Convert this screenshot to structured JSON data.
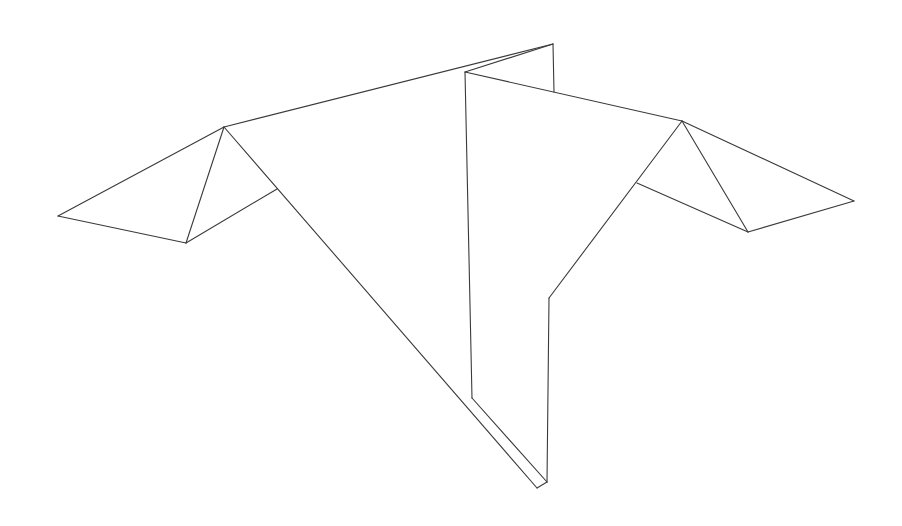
{
  "figure": {
    "stroke_color": "#3a3a3a",
    "background": "#ffffff",
    "edges": [
      {
        "id": "left-wing-upper",
        "x1": 58,
        "y1": 216,
        "x2": 224,
        "y2": 127
      },
      {
        "id": "left-wing-lower",
        "x1": 58,
        "y1": 216,
        "x2": 186,
        "y2": 243
      },
      {
        "id": "left-wing-crease",
        "x1": 224,
        "y1": 127,
        "x2": 186,
        "y2": 243
      },
      {
        "id": "left-wing-inner",
        "x1": 186,
        "y1": 243,
        "x2": 277,
        "y2": 189
      },
      {
        "id": "top-left-ridge",
        "x1": 224,
        "y1": 127,
        "x2": 553,
        "y2": 44
      },
      {
        "id": "left-long-diagonal",
        "x1": 224,
        "y1": 127,
        "x2": 537,
        "y2": 488
      },
      {
        "id": "back-vertical",
        "x1": 553,
        "y1": 44,
        "x2": 554,
        "y2": 92
      },
      {
        "id": "inner-top-ridge",
        "x1": 465,
        "y1": 72,
        "x2": 553,
        "y2": 44
      },
      {
        "id": "top-right-ridge",
        "x1": 465,
        "y1": 72,
        "x2": 682,
        "y2": 121
      },
      {
        "id": "center-vertical",
        "x1": 465,
        "y1": 72,
        "x2": 472,
        "y2": 398
      },
      {
        "id": "center-lower-diagonal",
        "x1": 472,
        "y1": 398,
        "x2": 547,
        "y2": 482
      },
      {
        "id": "bottom-cap",
        "x1": 537,
        "y1": 488,
        "x2": 547,
        "y2": 482
      },
      {
        "id": "right-vertical",
        "x1": 547,
        "y1": 482,
        "x2": 549,
        "y2": 298
      },
      {
        "id": "right-diagonal",
        "x1": 549,
        "y1": 298,
        "x2": 682,
        "y2": 121
      },
      {
        "id": "right-wing-upper",
        "x1": 682,
        "y1": 121,
        "x2": 854,
        "y2": 201
      },
      {
        "id": "right-wing-crease",
        "x1": 682,
        "y1": 121,
        "x2": 748,
        "y2": 232
      },
      {
        "id": "right-wing-lower",
        "x1": 748,
        "y1": 232,
        "x2": 854,
        "y2": 201
      },
      {
        "id": "right-wing-inner",
        "x1": 637,
        "y1": 183,
        "x2": 748,
        "y2": 232
      }
    ]
  }
}
